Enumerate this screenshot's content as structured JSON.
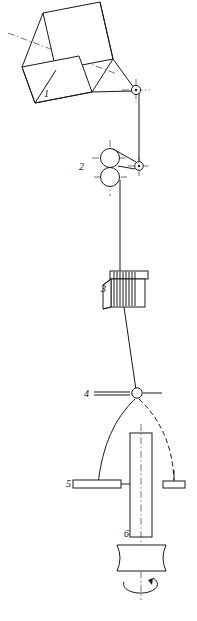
{
  "diagram": {
    "background_color": "#ffffff",
    "line_color": "#1a1a1a",
    "labels": [
      {
        "id": "1",
        "text": "1",
        "name": "supply-package",
        "x": 44,
        "y": 97
      },
      {
        "id": "2",
        "text": "2",
        "name": "feed-roller-pair",
        "x": 79,
        "y": 170
      },
      {
        "id": "3",
        "text": "3",
        "name": "heater-coil",
        "x": 101,
        "y": 292
      },
      {
        "id": "4",
        "text": "4",
        "name": "thread-guide",
        "x": 84,
        "y": 397
      },
      {
        "id": "5",
        "text": "5",
        "name": "ring-rail",
        "x": 66,
        "y": 487
      },
      {
        "id": "6",
        "text": "6",
        "name": "bobbin-spindle",
        "x": 124,
        "y": 537
      }
    ],
    "components": {
      "package": {
        "name": "supply-package",
        "label": "1"
      },
      "top_guide": {
        "name": "top-thread-guide-eyelet",
        "label": ""
      },
      "rollers": {
        "name": "feed-roller-pair",
        "label": "2"
      },
      "drive_pulley": {
        "name": "drive-pulley",
        "label": ""
      },
      "heater": {
        "name": "heater-coil-unit",
        "label": "3"
      },
      "guide_eye": {
        "name": "balloon-thread-guide",
        "label": "4"
      },
      "balloon": {
        "name": "yarn-balloon",
        "label": ""
      },
      "ring_rail_left": {
        "name": "ring-rail-left-bracket",
        "label": "5"
      },
      "ring_rail_right": {
        "name": "ring-rail-right-traveler",
        "label": ""
      },
      "bobbin": {
        "name": "bobbin",
        "label": "6"
      },
      "whorl": {
        "name": "spindle-whorl",
        "label": ""
      },
      "rotation": {
        "name": "spindle-rotation-arrow",
        "label": ""
      }
    }
  }
}
